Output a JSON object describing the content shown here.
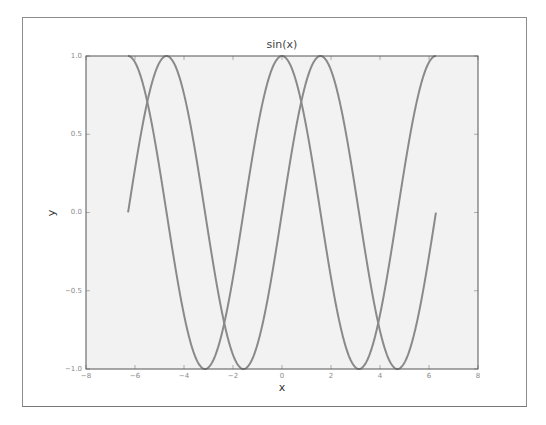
{
  "chart_data": {
    "type": "line",
    "title": "sin(x)",
    "xlabel": "x",
    "ylabel": "y",
    "xlim": [
      -8,
      8
    ],
    "ylim": [
      -1.0,
      1.0
    ],
    "grid": false,
    "legend": null,
    "x_ticks": [
      "-8",
      "-6",
      "-4",
      "-2",
      "0",
      "2",
      "4",
      "6",
      "8"
    ],
    "y_ticks": [
      "1.0",
      "0.5",
      "0.0",
      "-0.5",
      "-1.0"
    ],
    "series": [
      {
        "name": "sin(x)",
        "function": "sin",
        "x_range": [
          -6.283,
          6.283
        ],
        "color": "#8a8a8a"
      },
      {
        "name": "cos(x)",
        "function": "cos",
        "x_range": [
          -6.283,
          6.283
        ],
        "color": "#8a8a8a"
      }
    ],
    "background_color": "#f2f2f2",
    "line_color": "#8a8a8a"
  },
  "labels": {
    "title": "sin(x)",
    "xlabel": "x",
    "ylabel": "y",
    "x_ticks": [
      "−8",
      "−6",
      "−4",
      "−2",
      "0",
      "2",
      "4",
      "6",
      "8"
    ],
    "y_ticks": [
      "1.0",
      "0.5",
      "0.0",
      "−0.5",
      "−1.0"
    ]
  }
}
